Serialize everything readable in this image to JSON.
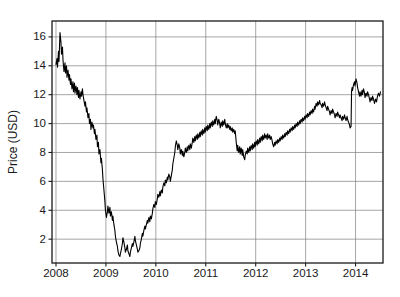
{
  "chart_data": {
    "type": "line",
    "title": "",
    "xlabel": "",
    "ylabel": "Price (USD)",
    "xlim": [
      2007.92,
      2014.55
    ],
    "ylim": [
      0.35,
      17.1
    ],
    "xticks": [
      2008,
      2009,
      2010,
      2011,
      2012,
      2013,
      2014
    ],
    "xtick_labels": [
      "2008",
      "2009",
      "2010",
      "2011",
      "2012",
      "2013",
      "2014"
    ],
    "yticks": [
      2,
      4,
      6,
      8,
      10,
      12,
      14,
      16
    ],
    "ytick_labels": [
      "2",
      "4",
      "6",
      "8",
      "10",
      "12",
      "14",
      "16"
    ],
    "grid": true,
    "grid_color": "#808080",
    "axis_color": "#1a1a1a",
    "line_color": "#000000",
    "line_width": 1.1,
    "background": "#ffffff",
    "legend": null,
    "series": [
      {
        "name": "Price",
        "x": [
          2008.0,
          2008.02,
          2008.03,
          2008.05,
          2008.06,
          2008.08,
          2008.1,
          2008.11,
          2008.13,
          2008.14,
          2008.16,
          2008.18,
          2008.19,
          2008.21,
          2008.22,
          2008.24,
          2008.26,
          2008.27,
          2008.29,
          2008.3,
          2008.32,
          2008.34,
          2008.35,
          2008.37,
          2008.38,
          2008.4,
          2008.42,
          2008.43,
          2008.45,
          2008.46,
          2008.48,
          2008.5,
          2008.51,
          2008.53,
          2008.54,
          2008.56,
          2008.58,
          2008.59,
          2008.61,
          2008.62,
          2008.64,
          2008.66,
          2008.67,
          2008.69,
          2008.7,
          2008.72,
          2008.74,
          2008.75,
          2008.77,
          2008.78,
          2008.8,
          2008.82,
          2008.83,
          2008.85,
          2008.86,
          2008.88,
          2008.9,
          2008.91,
          2008.93,
          2008.94,
          2008.96,
          2008.98,
          2008.99,
          2009.01,
          2009.03,
          2009.04,
          2009.06,
          2009.08,
          2009.09,
          2009.11,
          2009.13,
          2009.14,
          2009.16,
          2009.18,
          2009.19,
          2009.21,
          2009.23,
          2009.24,
          2009.26,
          2009.28,
          2009.29,
          2009.31,
          2009.33,
          2009.34,
          2009.36,
          2009.38,
          2009.39,
          2009.41,
          2009.43,
          2009.44,
          2009.46,
          2009.48,
          2009.49,
          2009.51,
          2009.53,
          2009.54,
          2009.56,
          2009.58,
          2009.59,
          2009.61,
          2009.63,
          2009.64,
          2009.66,
          2009.68,
          2009.69,
          2009.71,
          2009.73,
          2009.74,
          2009.76,
          2009.78,
          2009.79,
          2009.81,
          2009.83,
          2009.84,
          2009.86,
          2009.88,
          2009.89,
          2009.91,
          2009.93,
          2009.94,
          2009.96,
          2009.98,
          2009.99,
          2010.01,
          2010.03,
          2010.04,
          2010.06,
          2010.08,
          2010.09,
          2010.11,
          2010.13,
          2010.14,
          2010.16,
          2010.18,
          2010.19,
          2010.21,
          2010.23,
          2010.24,
          2010.26,
          2010.28,
          2010.29,
          2010.31,
          2010.33,
          2010.34,
          2010.36,
          2010.38,
          2010.39,
          2010.41,
          2010.43,
          2010.44,
          2010.46,
          2010.48,
          2010.49,
          2010.51,
          2010.53,
          2010.54,
          2010.56,
          2010.58,
          2010.59,
          2010.61,
          2010.63,
          2010.64,
          2010.66,
          2010.68,
          2010.69,
          2010.71,
          2010.73,
          2010.74,
          2010.76,
          2010.78,
          2010.79,
          2010.81,
          2010.83,
          2010.84,
          2010.86,
          2010.88,
          2010.89,
          2010.91,
          2010.93,
          2010.94,
          2010.96,
          2010.98,
          2010.99,
          2011.01,
          2011.03,
          2011.04,
          2011.06,
          2011.08,
          2011.09,
          2011.11,
          2011.13,
          2011.14,
          2011.16,
          2011.18,
          2011.19,
          2011.21,
          2011.23,
          2011.24,
          2011.26,
          2011.28,
          2011.29,
          2011.31,
          2011.33,
          2011.34,
          2011.36,
          2011.38,
          2011.39,
          2011.41,
          2011.43,
          2011.44,
          2011.46,
          2011.48,
          2011.49,
          2011.51,
          2011.53,
          2011.54,
          2011.56,
          2011.58,
          2011.59,
          2011.61,
          2011.63,
          2011.64,
          2011.66,
          2011.68,
          2011.69,
          2011.71,
          2011.73,
          2011.74,
          2011.76,
          2011.78,
          2011.79,
          2011.81,
          2011.83,
          2011.84,
          2011.86,
          2011.88,
          2011.89,
          2011.91,
          2011.93,
          2011.94,
          2011.96,
          2011.98,
          2011.99,
          2012.01,
          2012.03,
          2012.04,
          2012.06,
          2012.08,
          2012.09,
          2012.11,
          2012.13,
          2012.14,
          2012.16,
          2012.18,
          2012.19,
          2012.21,
          2012.23,
          2012.24,
          2012.26,
          2012.28,
          2012.29,
          2012.31,
          2012.33,
          2012.34,
          2012.36,
          2012.38,
          2012.39,
          2012.41,
          2012.43,
          2012.44,
          2012.46,
          2012.48,
          2012.49,
          2012.51,
          2012.53,
          2012.54,
          2012.56,
          2012.58,
          2012.59,
          2012.61,
          2012.63,
          2012.64,
          2012.66,
          2012.68,
          2012.69,
          2012.71,
          2012.73,
          2012.74,
          2012.76,
          2012.78,
          2012.79,
          2012.81,
          2012.83,
          2012.84,
          2012.86,
          2012.88,
          2012.89,
          2012.91,
          2012.93,
          2012.94,
          2012.96,
          2012.98,
          2012.99,
          2013.01,
          2013.03,
          2013.04,
          2013.06,
          2013.08,
          2013.09,
          2013.11,
          2013.13,
          2013.14,
          2013.16,
          2013.18,
          2013.19,
          2013.21,
          2013.23,
          2013.24,
          2013.26,
          2013.28,
          2013.29,
          2013.31,
          2013.33,
          2013.34,
          2013.36,
          2013.38,
          2013.39,
          2013.41,
          2013.43,
          2013.44,
          2013.46,
          2013.48,
          2013.49,
          2013.51,
          2013.53,
          2013.54,
          2013.56,
          2013.58,
          2013.59,
          2013.61,
          2013.63,
          2013.64,
          2013.66,
          2013.68,
          2013.69,
          2013.71,
          2013.73,
          2013.74,
          2013.76,
          2013.78,
          2013.79,
          2013.81,
          2013.83,
          2013.84,
          2013.86,
          2013.88,
          2013.89,
          2013.91,
          2013.92,
          2013.93,
          2013.94,
          2013.96,
          2013.98,
          2013.99,
          2014.01,
          2014.03,
          2014.04,
          2014.06,
          2014.08,
          2014.09,
          2014.11,
          2014.13,
          2014.14,
          2014.16,
          2014.18,
          2014.19,
          2014.21,
          2014.23,
          2014.24,
          2014.26,
          2014.28,
          2014.29,
          2014.31,
          2014.33,
          2014.34,
          2014.36,
          2014.38,
          2014.4,
          2014.42,
          2014.44,
          2014.46,
          2014.48,
          2014.5
        ],
        "y": [
          14.1,
          14.5,
          13.9,
          15.0,
          14.3,
          16.3,
          15.6,
          14.8,
          15.3,
          14.4,
          13.6,
          14.2,
          13.5,
          14.0,
          13.2,
          13.7,
          13.0,
          13.4,
          12.7,
          13.1,
          12.4,
          12.9,
          12.2,
          12.8,
          12.1,
          12.6,
          12.0,
          12.5,
          11.8,
          12.3,
          11.7,
          12.2,
          11.9,
          12.4,
          12.0,
          11.6,
          11.2,
          11.5,
          10.8,
          11.1,
          10.4,
          10.7,
          10.0,
          10.3,
          9.6,
          10.1,
          9.7,
          9.9,
          9.3,
          9.6,
          8.9,
          9.2,
          8.4,
          8.7,
          7.9,
          8.2,
          7.3,
          7.6,
          6.8,
          6.2,
          5.4,
          4.6,
          4.0,
          3.5,
          3.9,
          4.3,
          3.8,
          4.2,
          3.6,
          3.9,
          3.3,
          3.6,
          3.0,
          2.6,
          2.2,
          1.8,
          1.5,
          1.2,
          0.9,
          0.8,
          1.0,
          1.3,
          1.7,
          2.1,
          1.8,
          1.4,
          1.1,
          1.3,
          1.6,
          1.2,
          1.0,
          0.8,
          1.1,
          1.4,
          1.7,
          1.5,
          1.8,
          2.2,
          1.9,
          1.6,
          1.3,
          1.1,
          1.2,
          1.4,
          1.7,
          2.0,
          2.4,
          2.2,
          2.6,
          2.9,
          2.7,
          3.0,
          3.3,
          3.1,
          3.5,
          3.2,
          3.6,
          3.4,
          3.8,
          4.1,
          4.4,
          4.2,
          4.6,
          4.4,
          4.8,
          5.1,
          4.9,
          5.3,
          5.0,
          5.4,
          5.2,
          5.6,
          5.9,
          5.7,
          6.1,
          5.9,
          6.3,
          6.1,
          6.5,
          6.3,
          6.0,
          6.4,
          6.8,
          7.2,
          7.6,
          8.0,
          8.4,
          8.8,
          8.5,
          8.2,
          8.6,
          8.3,
          7.9,
          8.2,
          7.8,
          8.1,
          7.7,
          8.0,
          8.3,
          8.0,
          8.4,
          8.1,
          8.5,
          8.2,
          8.6,
          8.3,
          8.7,
          9.0,
          8.7,
          9.1,
          8.8,
          9.2,
          8.9,
          9.3,
          9.0,
          9.4,
          9.1,
          9.5,
          9.2,
          9.6,
          9.3,
          9.7,
          9.4,
          9.8,
          9.5,
          9.9,
          9.6,
          10.0,
          9.7,
          10.1,
          9.8,
          10.2,
          9.9,
          10.3,
          10.0,
          10.5,
          10.2,
          9.9,
          10.3,
          10.0,
          9.7,
          10.1,
          9.8,
          10.2,
          9.9,
          10.3,
          10.0,
          9.7,
          10.0,
          9.7,
          9.9,
          9.6,
          9.8,
          9.5,
          9.7,
          9.4,
          9.6,
          9.3,
          9.5,
          8.7,
          8.1,
          8.5,
          8.0,
          8.4,
          7.9,
          8.3,
          7.8,
          8.2,
          7.7,
          7.5,
          7.8,
          8.1,
          7.9,
          8.3,
          8.0,
          8.4,
          8.1,
          8.5,
          8.2,
          8.6,
          8.3,
          8.7,
          8.4,
          8.8,
          8.5,
          8.9,
          8.6,
          9.0,
          8.7,
          9.1,
          8.8,
          9.2,
          8.9,
          9.3,
          9.0,
          9.2,
          8.9,
          9.3,
          9.0,
          9.2,
          8.9,
          9.1,
          8.8,
          8.6,
          8.4,
          8.7,
          8.5,
          8.8,
          8.6,
          8.9,
          8.7,
          9.0,
          8.8,
          9.1,
          8.9,
          9.2,
          9.0,
          9.3,
          9.1,
          9.4,
          9.2,
          9.5,
          9.3,
          9.6,
          9.4,
          9.7,
          9.5,
          9.8,
          9.6,
          9.9,
          9.7,
          10.0,
          9.8,
          10.1,
          9.9,
          10.2,
          10.0,
          10.3,
          10.1,
          10.4,
          10.2,
          10.5,
          10.3,
          10.6,
          10.4,
          10.7,
          10.5,
          10.8,
          10.6,
          10.9,
          10.7,
          11.0,
          10.8,
          11.2,
          11.0,
          11.4,
          11.2,
          11.5,
          11.3,
          11.6,
          11.4,
          11.3,
          11.1,
          11.4,
          11.2,
          11.5,
          11.3,
          11.1,
          10.9,
          11.2,
          11.0,
          10.8,
          10.6,
          10.9,
          10.7,
          11.0,
          10.8,
          10.6,
          10.4,
          10.7,
          10.5,
          10.8,
          10.6,
          10.4,
          10.6,
          10.4,
          10.2,
          10.5,
          10.3,
          10.6,
          10.4,
          10.2,
          10.5,
          10.3,
          10.1,
          9.9,
          9.7,
          9.8,
          12.2,
          12.5,
          12.3,
          12.7,
          12.9,
          12.6,
          13.1,
          12.8,
          12.5,
          12.2,
          11.9,
          12.2,
          11.9,
          12.3,
          12.0,
          12.4,
          12.1,
          11.8,
          12.1,
          11.9,
          12.2,
          12.0,
          11.7,
          11.5,
          11.8,
          11.6,
          11.9,
          11.7,
          11.4,
          11.7,
          11.5,
          11.9,
          12.1,
          11.9,
          12.2
        ]
      }
    ]
  },
  "figure": {
    "plot_left": 52,
    "plot_right": 383,
    "plot_top": 21,
    "plot_bottom": 263
  }
}
